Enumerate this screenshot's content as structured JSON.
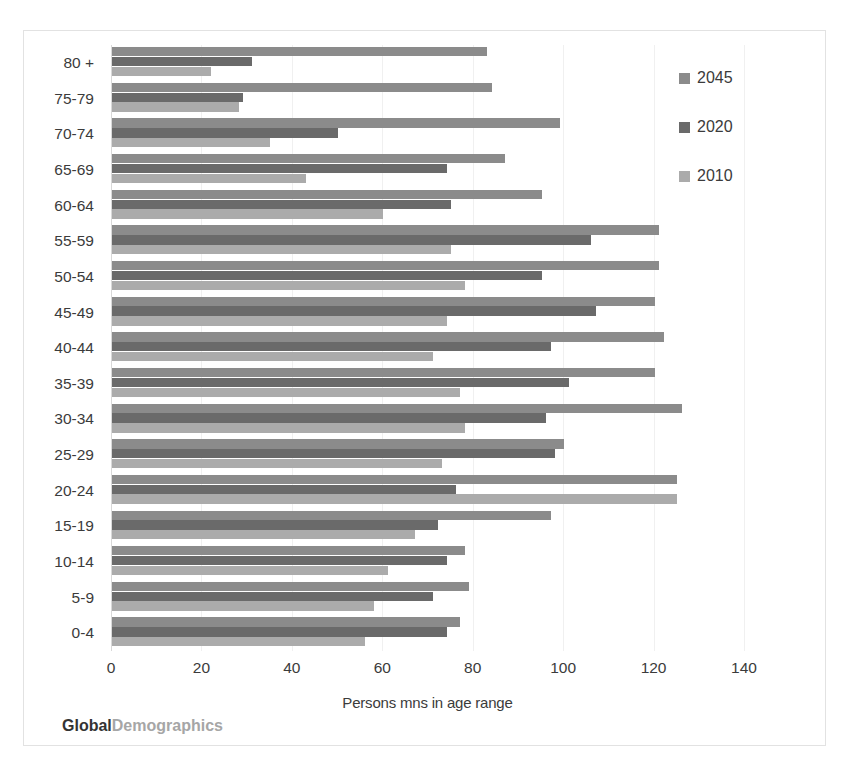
{
  "watermark": {
    "primary": "Global",
    "secondary": "Demographics"
  },
  "axis": {
    "x_title": "Persons mns in age range",
    "x_ticks": [
      "0",
      "20",
      "40",
      "60",
      "80",
      "100",
      "120",
      "140"
    ],
    "y_title": ""
  },
  "legend": {
    "position": "right",
    "entries": [
      {
        "label": "2045",
        "color": "#8b8b8b"
      },
      {
        "label": "2020",
        "color": "#6a6a6a"
      },
      {
        "label": "2010",
        "color": "#ababab"
      }
    ]
  },
  "colors": {
    "series_2045": "#8b8b8b",
    "series_2020": "#6a6a6a",
    "series_2010": "#ababab",
    "frame": "#e2e2e2",
    "gridline": "#f0f0f0",
    "text": "#3b3b3b"
  },
  "chart_data": {
    "type": "bar",
    "orientation": "horizontal",
    "title": "",
    "subtitle": "",
    "xlabel": "Persons mns in age range",
    "ylabel": "",
    "xlim": [
      0,
      140
    ],
    "xticks": [
      0,
      20,
      40,
      60,
      80,
      100,
      120,
      140
    ],
    "grid": true,
    "legend_position": "right",
    "categories": [
      "80 +",
      "75-79",
      "70-74",
      "65-69",
      "60-64",
      "55-59",
      "50-54",
      "45-49",
      "40-44",
      "35-39",
      "30-34",
      "25-29",
      "20-24",
      "15-19",
      "10-14",
      "5-9",
      "0-4"
    ],
    "series": [
      {
        "name": "2045",
        "color": "#8b8b8b",
        "values": [
          83,
          84,
          99,
          87,
          95,
          121,
          121,
          120,
          122,
          120,
          126,
          100,
          125,
          97,
          78,
          79,
          77
        ]
      },
      {
        "name": "2020",
        "color": "#6a6a6a",
        "values": [
          31,
          29,
          50,
          74,
          75,
          106,
          95,
          107,
          97,
          101,
          96,
          98,
          76,
          72,
          74,
          71,
          74
        ]
      },
      {
        "name": "2010",
        "color": "#ababab",
        "values": [
          22,
          28,
          35,
          43,
          60,
          75,
          78,
          74,
          71,
          77,
          78,
          73,
          125,
          67,
          61,
          58,
          56
        ]
      }
    ]
  }
}
